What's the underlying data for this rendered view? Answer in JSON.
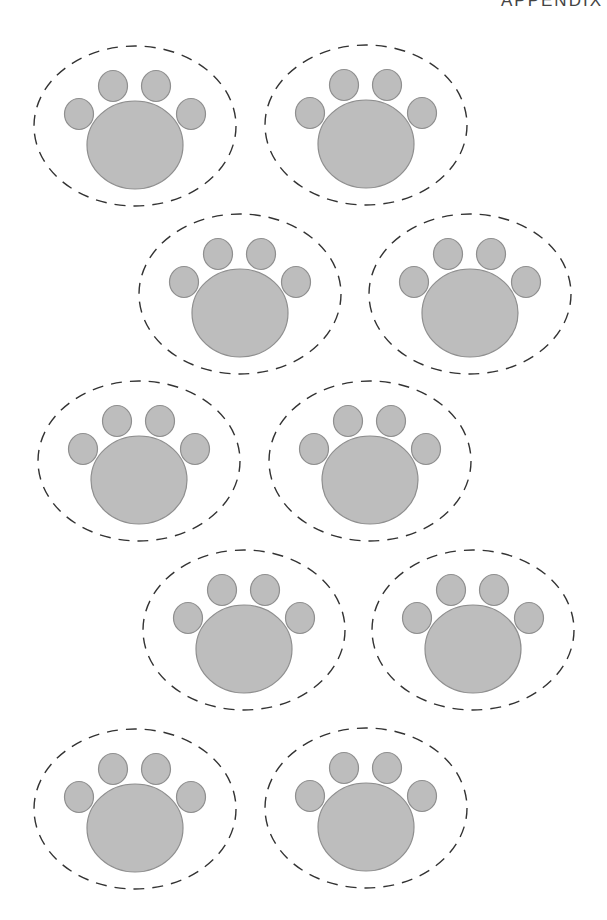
{
  "header": {
    "text": "APPENDIX"
  },
  "style": {
    "paw_fill": "#bdbdbd",
    "paw_stroke": "#8f8f8f",
    "outline_stroke": "#333333",
    "background": "#ffffff"
  },
  "paws": [
    {
      "id": 1,
      "cx": 135,
      "cy": 122
    },
    {
      "id": 2,
      "cx": 366,
      "cy": 121
    },
    {
      "id": 3,
      "cx": 240,
      "cy": 290
    },
    {
      "id": 4,
      "cx": 470,
      "cy": 290
    },
    {
      "id": 5,
      "cx": 139,
      "cy": 457
    },
    {
      "id": 6,
      "cx": 370,
      "cy": 457
    },
    {
      "id": 7,
      "cx": 244,
      "cy": 626
    },
    {
      "id": 8,
      "cx": 473,
      "cy": 626
    },
    {
      "id": 9,
      "cx": 135,
      "cy": 805
    },
    {
      "id": 10,
      "cx": 366,
      "cy": 804
    }
  ]
}
